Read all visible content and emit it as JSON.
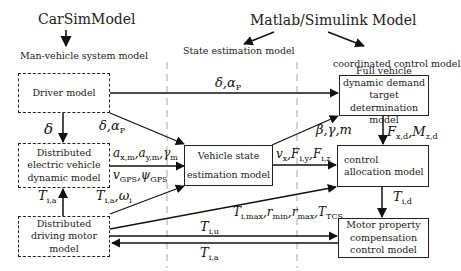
{
  "headers": {
    "carsim": "CarSimModel",
    "matlab": "Matlab/Simulink Model",
    "col1": "Man-vehicle system model",
    "col2": "State estimation model",
    "col3": "coordinated control model"
  },
  "boxes": {
    "driver": "Driver model",
    "vehicle_dynamic": "Distributed electric vehicle dynamic model",
    "motor": "Distributed driving motor model",
    "state_est_line1": "Vehicle state",
    "state_est_line2": "estimation model",
    "full_vehicle": "Full vehicle dynamic demand target determination model",
    "control_alloc_line1": "control",
    "control_alloc_line2": "allocation model",
    "motor_comp": "Motor property compensation control model"
  },
  "signals": {
    "driver_to_full": "δ,α_P",
    "driver_to_vd": "δ",
    "driver_to_se": "δ,α_P",
    "vd_to_se_1": "a_x,m, a_y,m, γ_m",
    "vd_to_se_2": "v_GPS, ψ_GPS",
    "motor_to_vd": "T_i,a",
    "motor_to_se": "T_i,a, ω_i",
    "se_to_full": "β,γ,m",
    "se_to_ca": "v_x, F_i,y, F_i,z",
    "full_to_ca": "F_x,d, M_z,d",
    "motor_to_ca": "T_i,max, r_min, r_max, T_TCS",
    "motor_to_mc": "T_i,u",
    "ca_to_mc": "T_i,d",
    "mc_to_motor": "T_i,a"
  },
  "colors": {
    "line": "#222222",
    "separator": "#aaaaaa",
    "background": "#ffffff"
  }
}
